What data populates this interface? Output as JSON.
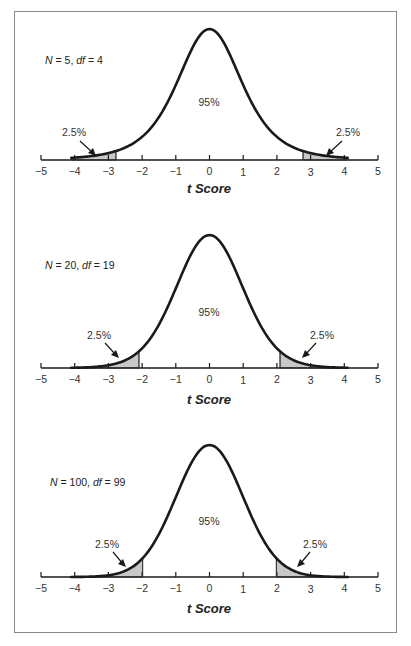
{
  "chart_data": [
    {
      "type": "area",
      "title": "N = 5, df = 4",
      "condition": {
        "n_label": "N",
        "n_value": "5",
        "df_label": "df",
        "df_value": "4"
      },
      "xlabel": "t Score",
      "ylabel": "",
      "xlim": [
        -5,
        5
      ],
      "x_ticks": [
        "−5",
        "−4",
        "−3",
        "−2",
        "−1",
        "0",
        "1",
        "2",
        "3",
        "4",
        "5"
      ],
      "df": 4,
      "critical_t": 2.776,
      "center_label": "95%",
      "left_tail_label": "2.5%",
      "right_tail_label": "2.5%",
      "grid": false,
      "legend": null
    },
    {
      "type": "area",
      "title": "N = 20, df = 19",
      "condition": {
        "n_label": "N",
        "n_value": "20",
        "df_label": "df",
        "df_value": "19"
      },
      "xlabel": "t Score",
      "ylabel": "",
      "xlim": [
        -5,
        5
      ],
      "x_ticks": [
        "−5",
        "−4",
        "−3",
        "−2",
        "−1",
        "0",
        "1",
        "2",
        "3",
        "4",
        "5"
      ],
      "df": 19,
      "critical_t": 2.093,
      "center_label": "95%",
      "left_tail_label": "2.5%",
      "right_tail_label": "2.5%",
      "grid": false,
      "legend": null
    },
    {
      "type": "area",
      "title": "N = 100, df = 99",
      "condition": {
        "n_label": "N",
        "n_value": "100",
        "df_label": "df",
        "df_value": "99"
      },
      "xlabel": "t Score",
      "ylabel": "",
      "xlim": [
        -5,
        5
      ],
      "x_ticks": [
        "−5",
        "−4",
        "−3",
        "−2",
        "−1",
        "0",
        "1",
        "2",
        "3",
        "4",
        "5"
      ],
      "df": 99,
      "critical_t": 1.984,
      "center_label": "95%",
      "left_tail_label": "2.5%",
      "right_tail_label": "2.5%",
      "grid": false,
      "legend": null
    }
  ],
  "colors": {
    "curve": "#1a1a1a",
    "tail_fill": "#c8c8c8",
    "axis": "#1a1a1a",
    "frame": "#8a8a8a"
  }
}
